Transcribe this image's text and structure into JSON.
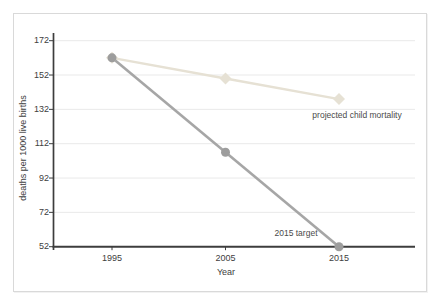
{
  "chart_data": {
    "type": "line",
    "title": "",
    "xlabel": "Year",
    "ylabel": "deaths per 1000 live births",
    "categories": [
      "1995",
      "2005",
      "2015"
    ],
    "y_ticks": [
      52,
      72,
      92,
      112,
      132,
      152,
      172
    ],
    "ylim": [
      52,
      172
    ],
    "grid": "horizontal gridlines at every y tick, light gray",
    "legend": "none - series labeled by inline text annotations",
    "series": [
      {
        "name": "projected child mortality",
        "marker": "diamond",
        "color": "#e6e1d4",
        "values": [
          162,
          150,
          138
        ]
      },
      {
        "name": "2015 target",
        "marker": "circle",
        "color": "#a6a6a6",
        "marker_color": "#9d9d9d",
        "values": [
          162,
          107,
          52
        ]
      }
    ],
    "annotations": [
      {
        "text": "projected child mortality",
        "series": "projected child mortality"
      },
      {
        "text": "2015 target",
        "series": "2015 target"
      }
    ],
    "colors": {
      "axis": "#3d3d3d",
      "grid": "#e9e9e9",
      "text": "#404040",
      "panel_border": "#d9d9d9",
      "background": "#ffffff"
    }
  }
}
